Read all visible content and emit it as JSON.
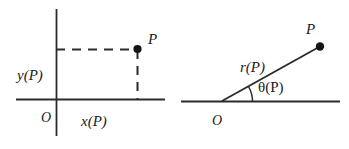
{
  "figure": {
    "background_color": "#ffffff",
    "stroke_color": "#2b2b2b",
    "text_color": "#1a1a1a"
  },
  "cartesian_panel": {
    "name": "cartesian-coordinates-diagram",
    "origin_label": "O",
    "x_label": "x(P)",
    "y_label": "y(P)",
    "point_label": "P"
  },
  "polar_panel": {
    "name": "polar-coordinates-diagram",
    "origin_label": "O",
    "radius_label": "r(P)",
    "angle_label": "θ(P)",
    "point_label": "P"
  }
}
